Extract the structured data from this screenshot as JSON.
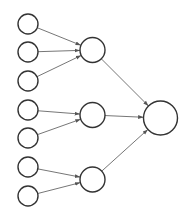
{
  "diagram": {
    "type": "tree-network",
    "colors": {
      "node_stroke": "#333333",
      "node_fill": "#ffffff",
      "edge": "#666666",
      "background": "#ffffff"
    },
    "nodes": [
      {
        "id": "in1",
        "layer": "input",
        "cx": 28,
        "cy": 24,
        "r": 10
      },
      {
        "id": "in2",
        "layer": "input",
        "cx": 28,
        "cy": 52,
        "r": 10
      },
      {
        "id": "in3",
        "layer": "input",
        "cx": 28,
        "cy": 81,
        "r": 10
      },
      {
        "id": "in4",
        "layer": "input",
        "cx": 28,
        "cy": 110,
        "r": 10
      },
      {
        "id": "in5",
        "layer": "input",
        "cx": 28,
        "cy": 138,
        "r": 10
      },
      {
        "id": "in6",
        "layer": "input",
        "cx": 28,
        "cy": 167,
        "r": 10
      },
      {
        "id": "in7",
        "layer": "input",
        "cx": 28,
        "cy": 196,
        "r": 10
      },
      {
        "id": "h1",
        "layer": "hidden",
        "cx": 92.5,
        "cy": 50,
        "r": 12.5
      },
      {
        "id": "h2",
        "layer": "hidden",
        "cx": 92.5,
        "cy": 115,
        "r": 12.5
      },
      {
        "id": "h3",
        "layer": "hidden",
        "cx": 92.5,
        "cy": 179.5,
        "r": 12.5
      },
      {
        "id": "out",
        "layer": "output",
        "cx": 160.5,
        "cy": 118,
        "r": 17
      }
    ],
    "edges": [
      {
        "from": "in1",
        "to": "h1"
      },
      {
        "from": "in2",
        "to": "h1"
      },
      {
        "from": "in3",
        "to": "h1"
      },
      {
        "from": "in4",
        "to": "h2"
      },
      {
        "from": "in5",
        "to": "h2"
      },
      {
        "from": "in6",
        "to": "h3"
      },
      {
        "from": "in7",
        "to": "h3"
      },
      {
        "from": "h1",
        "to": "out"
      },
      {
        "from": "h2",
        "to": "out"
      },
      {
        "from": "h3",
        "to": "out"
      }
    ]
  }
}
